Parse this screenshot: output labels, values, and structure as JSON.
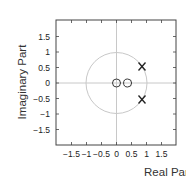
{
  "chart_data": {
    "type": "scatter",
    "title": "",
    "xlabel": "Real Part",
    "ylabel": "Imaginary Part",
    "xlim": [
      -2,
      2
    ],
    "ylim": [
      -2,
      2
    ],
    "xticks": [
      "-1.5",
      "-1",
      "-0.5",
      "0",
      "0.5",
      "1",
      "1.5"
    ],
    "yticks": [
      "1.5",
      "1",
      "0.5",
      "0",
      "-0.5",
      "-1",
      "-1.5"
    ],
    "grid": false,
    "unit_circle": true,
    "series": [
      {
        "name": "zeros",
        "marker": "o",
        "points": [
          [
            0.0,
            0.0
          ],
          [
            0.37,
            0.0
          ]
        ]
      },
      {
        "name": "poles",
        "marker": "x",
        "points": [
          [
            0.85,
            0.53
          ],
          [
            0.85,
            -0.53
          ]
        ]
      }
    ],
    "colors": {
      "axis": "#333333",
      "circle": "#c8c8c8",
      "markers": "#222222"
    }
  }
}
